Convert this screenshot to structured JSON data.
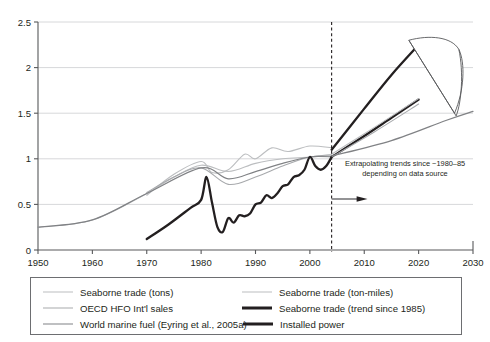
{
  "chart_data": {
    "type": "line",
    "title": "",
    "xlabel": "",
    "ylabel": "",
    "xlim": [
      1950,
      2030
    ],
    "ylim": [
      0,
      2.5
    ],
    "xticks": [
      1950,
      1960,
      1970,
      1980,
      1990,
      2000,
      2010,
      2020,
      2030
    ],
    "yticks": [
      0,
      0.5,
      1,
      1.5,
      2,
      2.5
    ],
    "grid": "horizontal",
    "legend_position": "below-plot",
    "annotations": [
      {
        "name": "extrapolation-note",
        "line1": "Extrapolating trends since ~1980–85",
        "line2": "depending on data source"
      },
      {
        "name": "extrapolation-divider",
        "style": "dashed-vertical",
        "x": 2004
      }
    ],
    "series": [
      {
        "name": "Seaborne trade (tons)",
        "color": "#bcbec0",
        "width": 1.1,
        "x": [
          1950,
          1960,
          1970,
          1975,
          1980,
          1985,
          1990,
          1995,
          2000,
          2004
        ],
        "values": [
          0.25,
          0.33,
          0.62,
          0.8,
          0.93,
          0.86,
          0.95,
          1.0,
          1.02,
          1.05
        ]
      },
      {
        "name": "Seaborne trade (ton-miles)",
        "color": "#bcbec0",
        "width": 1.1,
        "x": [
          1970,
          1975,
          1980,
          1982,
          1985,
          1988,
          1990,
          1993,
          1996,
          2000,
          2004
        ],
        "values": [
          0.6,
          0.83,
          0.97,
          0.85,
          0.88,
          1.05,
          1.0,
          1.12,
          1.08,
          1.14,
          1.12
        ]
      },
      {
        "name": "OECD HFO Int'l sales",
        "color": "#a7a9ac",
        "width": 1.1,
        "x": [
          1970,
          1975,
          1980,
          1985,
          1990,
          1995,
          2000,
          2004
        ],
        "values": [
          0.63,
          0.8,
          0.9,
          0.72,
          0.8,
          0.92,
          1.02,
          1.02
        ]
      },
      {
        "name": "World marine fuel (Eyring et al., 2005a)",
        "color": "#808285",
        "width": 1.2,
        "x": [
          1950,
          1960,
          1970,
          1980,
          1985,
          1990,
          1995,
          2000,
          2004
        ],
        "values": [
          0.25,
          0.33,
          0.62,
          0.9,
          0.78,
          0.86,
          0.95,
          1.02,
          1.03
        ]
      },
      {
        "name": "Installed power",
        "color": "#231f20",
        "width": 2.3,
        "x": [
          1970,
          1974,
          1978,
          1980,
          1981,
          1982,
          1983,
          1984,
          1985,
          1986,
          1987,
          1988,
          1989,
          1990,
          1991,
          1992,
          1993,
          1994,
          1995,
          1996,
          1997,
          1998,
          1999,
          2000,
          2001,
          2002,
          2003,
          2004
        ],
        "values": [
          0.12,
          0.28,
          0.46,
          0.55,
          0.8,
          0.52,
          0.25,
          0.2,
          0.35,
          0.3,
          0.38,
          0.37,
          0.4,
          0.5,
          0.52,
          0.6,
          0.57,
          0.62,
          0.7,
          0.72,
          0.8,
          0.82,
          0.88,
          1.02,
          0.92,
          0.88,
          0.92,
          1.02
        ]
      },
      {
        "name": "Seaborne trade (trend since 1985)",
        "color": "#231f20",
        "width": 2.3,
        "x": [
          2004,
          2010,
          2015,
          2020
        ],
        "values": [
          1.1,
          1.55,
          1.92,
          2.25
        ]
      },
      {
        "name": "Installed power (extrapolated)",
        "color": "#231f20",
        "width": 2.3,
        "x": [
          2004,
          2010,
          2015,
          2020
        ],
        "values": [
          1.02,
          1.25,
          1.45,
          1.65
        ]
      },
      {
        "name": "Seaborne trade (tons) extrapolated",
        "color": "#bcbec0",
        "width": 1.1,
        "x": [
          2004,
          2012,
          2020
        ],
        "values": [
          1.05,
          1.35,
          1.66
        ]
      },
      {
        "name": "OECD HFO Int'l sales extrapolated",
        "color": "#a7a9ac",
        "width": 1.1,
        "x": [
          2004,
          2012,
          2020
        ],
        "values": [
          1.02,
          1.3,
          1.6
        ]
      },
      {
        "name": "World marine fuel extrapolated",
        "color": "#808285",
        "width": 1.2,
        "x": [
          2004,
          2015,
          2025,
          2030
        ],
        "values": [
          1.03,
          1.2,
          1.42,
          1.52
        ]
      }
    ],
    "uncertainty_wedge": {
      "name": "uncertainty-fan",
      "stroke": "#58595b",
      "fill": "#ffffff",
      "x_range": [
        2018,
        2029
      ],
      "y_range": [
        1.45,
        2.35
      ]
    }
  },
  "legend": {
    "rows": [
      {
        "left": {
          "label": "Seaborne trade (tons)",
          "color": "#bcbec0",
          "width": "1.2px"
        },
        "right": {
          "label": "Seaborne trade (ton-miles)",
          "color": "#bcbec0",
          "width": "1.2px"
        }
      },
      {
        "left": {
          "label": "OECD HFO Int'l sales",
          "color": "#a7a9ac",
          "width": "1.3px"
        },
        "right": {
          "label": "Seaborne trade (trend since 1985)",
          "color": "#231f20",
          "width": "3px"
        }
      },
      {
        "left": {
          "label": "World marine fuel (Eyring et al., 2005a)",
          "color": "#808285",
          "width": "1.6px"
        },
        "right": {
          "label": "Installed power",
          "color": "#231f20",
          "width": "3px"
        }
      }
    ]
  }
}
